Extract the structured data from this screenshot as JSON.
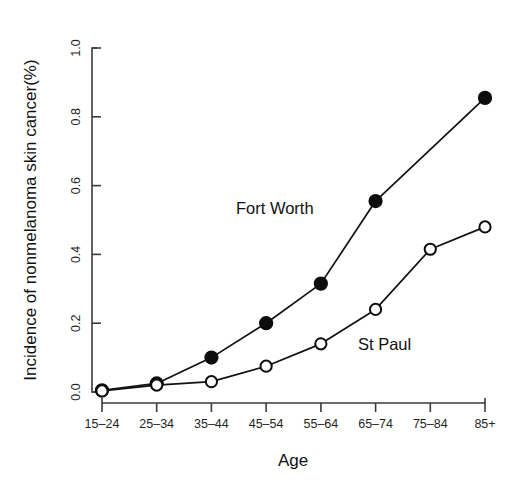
{
  "chart_data": {
    "type": "line",
    "title": "",
    "xlabel": "Age",
    "ylabel": "Incidence of nonmelanoma skin cancer(%)",
    "categories": [
      "15-24",
      "25-34",
      "35-44",
      "45-54",
      "55-64",
      "65-74",
      "75-84",
      "85+"
    ],
    "xtick_labels": [
      "15–24",
      "25–34",
      "35–44",
      "45–54",
      "55–64",
      "65–74",
      "75–84",
      "85+"
    ],
    "ylim": [
      0.0,
      1.0
    ],
    "ytick_values": [
      0.0,
      0.2,
      0.4,
      0.6,
      0.8,
      1.0
    ],
    "ytick_labels": [
      "0.0",
      "0.2",
      "0.4",
      "0.6",
      "0.8",
      "1.0"
    ],
    "grid": false,
    "legend_position": "inline-annotation",
    "series": [
      {
        "name": "Fort Worth",
        "marker": "filled-circle",
        "color": "#0d0d0d",
        "values": [
          0.005,
          0.025,
          0.1,
          0.2,
          0.315,
          0.555,
          null,
          0.855
        ]
      },
      {
        "name": "St Paul",
        "marker": "open-circle",
        "color": "#0d0d0d",
        "values": [
          0.003,
          0.02,
          0.03,
          0.075,
          0.14,
          0.24,
          0.415,
          0.48
        ]
      }
    ],
    "annotations": [
      {
        "text": "Fort Worth",
        "series": "Fort Worth"
      },
      {
        "text": "St Paul",
        "series": "St Paul"
      }
    ]
  },
  "axis": {
    "x_title": "Age",
    "y_title": "Incidence of nonmelanoma skin cancer(%)"
  },
  "labels": {
    "fort_worth": "Fort Worth",
    "st_paul": "St Paul",
    "x0": "15–24",
    "x1": "25–34",
    "x2": "35–44",
    "x3": "45–54",
    "x4": "55–64",
    "x5": "65–74",
    "x6": "75–84",
    "x7": "85+",
    "y0": "0.0",
    "y1": "0.2",
    "y2": "0.4",
    "y3": "0.6",
    "y4": "0.8",
    "y5": "1.0"
  }
}
